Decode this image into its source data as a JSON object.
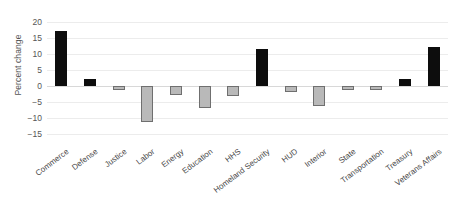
{
  "chart_data": {
    "type": "bar",
    "title": "",
    "xlabel": "",
    "ylabel": "Percent change",
    "ylim": [
      -17.5,
      21.5
    ],
    "yticks": [
      20,
      15,
      10,
      5,
      0,
      -5,
      -10,
      -15
    ],
    "ytick_labels": [
      "20",
      "15",
      "10",
      "5",
      "0",
      "−5",
      "−10",
      "−15"
    ],
    "grid": true,
    "legend": "none",
    "categories": [
      "Commerce",
      "Defense",
      "Justice",
      "Labor",
      "Energy",
      "Education",
      "HHS",
      "Homeland Security",
      "HUD",
      "Interior",
      "State",
      "Transportation",
      "Treasury",
      "Veterans Affairs"
    ],
    "values": [
      17.1,
      2.2,
      -1.2,
      -11.2,
      -3.0,
      -7.0,
      -3.3,
      11.4,
      -1.8,
      -6.2,
      -1.3,
      -1.3,
      2.1,
      12.3
    ],
    "bar_colors": [
      "#0d0d0d",
      "#0d0d0d",
      "#b9b9b9",
      "#b9b9b9",
      "#b9b9b9",
      "#b9b9b9",
      "#b9b9b9",
      "#0d0d0d",
      "#b9b9b9",
      "#b9b9b9",
      "#b9b9b9",
      "#b9b9b9",
      "#0d0d0d",
      "#0d0d0d"
    ],
    "colors": {
      "positive_dark": "#0d0d0d",
      "negative_light": "#b9b9b9",
      "bar_edge": "#6f6f6f",
      "gridline": "#ececec",
      "zero_line": "#d8d8d8",
      "text": "#4a4a4a",
      "background": "#ffffff"
    }
  }
}
